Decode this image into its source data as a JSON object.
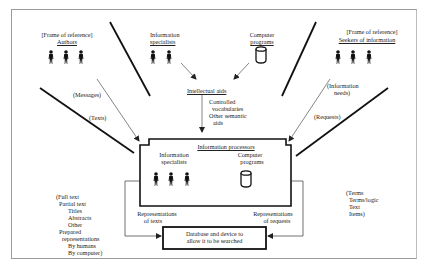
{
  "diagram": {
    "authors": {
      "frame_label": "[Frame of reference]",
      "title": "Authors",
      "icon": "person-icon",
      "count": 3
    },
    "info_specialists_top": {
      "line1": "Information",
      "line2": "specialists",
      "icon": "person-icon",
      "count": 2
    },
    "computer_programs_top": {
      "line1": "Computer",
      "line2": "programs",
      "icon": "cylinder-database-icon"
    },
    "seekers": {
      "frame_label": "[Frame of reference]",
      "title": "Seekers of information",
      "icon": "person-icon",
      "count": 3
    },
    "intellectual_aids": {
      "title": "Intellectual aids",
      "items": [
        "Controlled",
        "vocabularies",
        "Other semantic",
        "aids"
      ]
    },
    "flows": {
      "messages": "(Messages)",
      "texts": "(Texts)",
      "information_needs_1": "(Information",
      "information_needs_2": "needs)",
      "requests": "(Requests)"
    },
    "processors": {
      "title": "Information processors",
      "specialists_1": "Information",
      "specialists_2": "specialists",
      "programs_1": "Computer",
      "programs_2": "programs"
    },
    "rep_texts": {
      "line1": "Representations",
      "line2": "of texts"
    },
    "rep_requests": {
      "line1": "Representations",
      "line2": "of requests"
    },
    "database": {
      "line1": "Database and device to",
      "line2": "allow it to be searched"
    },
    "text_forms": [
      "(Full text",
      "Partial text",
      "Titles",
      "Abstracts",
      "Other",
      "Prepared",
      "representations",
      "By humans",
      "By computer)"
    ],
    "request_forms": [
      "(Terms",
      "Terms/logic",
      "Text",
      "Items)"
    ]
  }
}
